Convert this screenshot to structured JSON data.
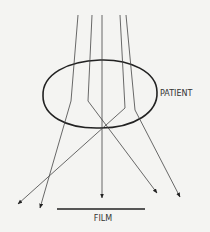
{
  "diagram": {
    "type": "x-ray scatter diagram",
    "labels": {
      "patient": "PATIENT",
      "film": "FILM"
    },
    "colors": {
      "background": "#f4f4f2",
      "lines": "#444444",
      "outline": "#222222",
      "text": "#333333"
    },
    "elements": [
      {
        "name": "patient-outline",
        "shape": "ellipse"
      },
      {
        "name": "film-line",
        "shape": "line"
      },
      {
        "name": "beam-1",
        "description": "enters left, deflected to far lower-left"
      },
      {
        "name": "beam-2",
        "description": "enters left-center, deflected to lower-right"
      },
      {
        "name": "beam-3",
        "description": "center beam passes straight to film"
      },
      {
        "name": "beam-4",
        "description": "enters right-center, deflected to far lower-left"
      },
      {
        "name": "beam-5",
        "description": "enters right, deflected to far lower-right"
      }
    ]
  }
}
